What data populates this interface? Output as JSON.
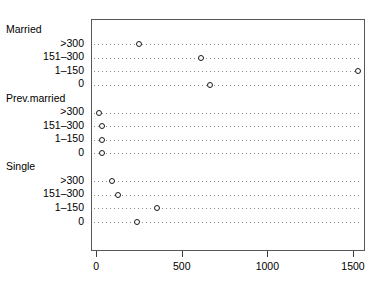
{
  "chart_data": {
    "type": "scatter",
    "subtype": "dotplot",
    "title": "",
    "xlabel": "",
    "ylabel": "",
    "xlim": [
      -30,
      1570
    ],
    "ylim": [
      0,
      13
    ],
    "grid": true,
    "grid_style": "dotted-horizontal",
    "legend": "none",
    "xticks": [
      0,
      500,
      1000,
      1500
    ],
    "xticklabels": [
      "0",
      "500",
      "1000",
      "1500"
    ],
    "groups": [
      {
        "name": "Married",
        "categories": [
          "&gt;300",
          "151–300",
          "1–150",
          "0"
        ],
        "values": [
          245,
          608,
          1526,
          660
        ]
      },
      {
        "name": "Prev.married",
        "categories": [
          "&gt;300",
          "151–300",
          "1–150",
          "0"
        ],
        "values": [
          10,
          30,
          28,
          26
        ]
      },
      {
        "name": "Single",
        "categories": [
          "&gt;300",
          "151–300",
          "1–150",
          "0"
        ],
        "values": [
          85,
          123,
          350,
          235
        ]
      }
    ],
    "rows": [
      {
        "label": "&gt;300",
        "group": "Married",
        "value": 245
      },
      {
        "label": "151–300",
        "group": "Married",
        "value": 608
      },
      {
        "label": "1–150",
        "group": "Married",
        "value": 1526
      },
      {
        "label": "0",
        "group": "Married",
        "value": 660
      },
      {
        "label": "&gt;300",
        "group": "Prev.married",
        "value": 10
      },
      {
        "label": "151–300",
        "group": "Prev.married",
        "value": 30
      },
      {
        "label": "1–150",
        "group": "Prev.married",
        "value": 28
      },
      {
        "label": "0",
        "group": "Prev.married",
        "value": 26
      },
      {
        "label": "&gt;300",
        "group": "Single",
        "value": 85
      },
      {
        "label": "151–300",
        "group": "Single",
        "value": 123
      },
      {
        "label": "1–150",
        "group": "Single",
        "value": 350
      },
      {
        "label": "0",
        "group": "Single",
        "value": 235
      }
    ],
    "colors": {
      "point": "#1a1a1a",
      "grid": "#8a8a8a",
      "frame": "#575757",
      "text": "#000000",
      "background": "#ffffff"
    }
  }
}
